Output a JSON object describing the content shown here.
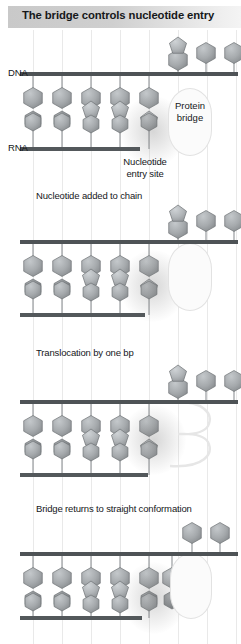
{
  "figure": {
    "title": "The bridge controls nucleotide entry",
    "type": "biology-mechanism-diagram",
    "panel_count": 5
  },
  "axis_labels": {
    "dna": "DNA",
    "rna": "RNA"
  },
  "annotations": {
    "protein_bridge": "Protein\nbridge",
    "protein_bridge_line1": "Protein",
    "protein_bridge_line2": "bridge",
    "nucleotide_entry_line1": "Nucleotide",
    "nucleotide_entry_line2": "entry site"
  },
  "panels": [
    {
      "index": 1,
      "caption": "",
      "dna_label": "DNA",
      "rna_label": "RNA",
      "bridge_state": "straight",
      "bridge_label": "Protein bridge",
      "entry_label": "Nucleotide entry site"
    },
    {
      "index": 2,
      "caption": "Nucleotide added to chain",
      "bridge_state": "straight"
    },
    {
      "index": 3,
      "caption": "Translocation by one bp",
      "bridge_state": "bent"
    },
    {
      "index": 4,
      "caption": "Bridge returns to straight conformation",
      "bridge_state": "straight"
    },
    {
      "index": 5,
      "caption": "",
      "bridge_state": "straight"
    }
  ],
  "colors": {
    "title_band_left": "#c9c9c9",
    "title_band_right": "#f4f4f4",
    "title_text": "#16181a",
    "strand": "#4e5356",
    "guide_line": "#e9e9e9",
    "hexagon_fill": "#9a9ea1",
    "hexagon_dark_fill": "#7d8184",
    "pentagon_fill": "#b0b4b7",
    "stem": "#8f9396",
    "bridge_outline": "#e2e2e2",
    "background": "#ffffff"
  },
  "legend_shapes": {
    "hexagon": "base",
    "pentagon": "sugar",
    "bar": "nucleic acid strand",
    "oval": "protein bridge straight",
    "bent": "protein bridge bent"
  }
}
